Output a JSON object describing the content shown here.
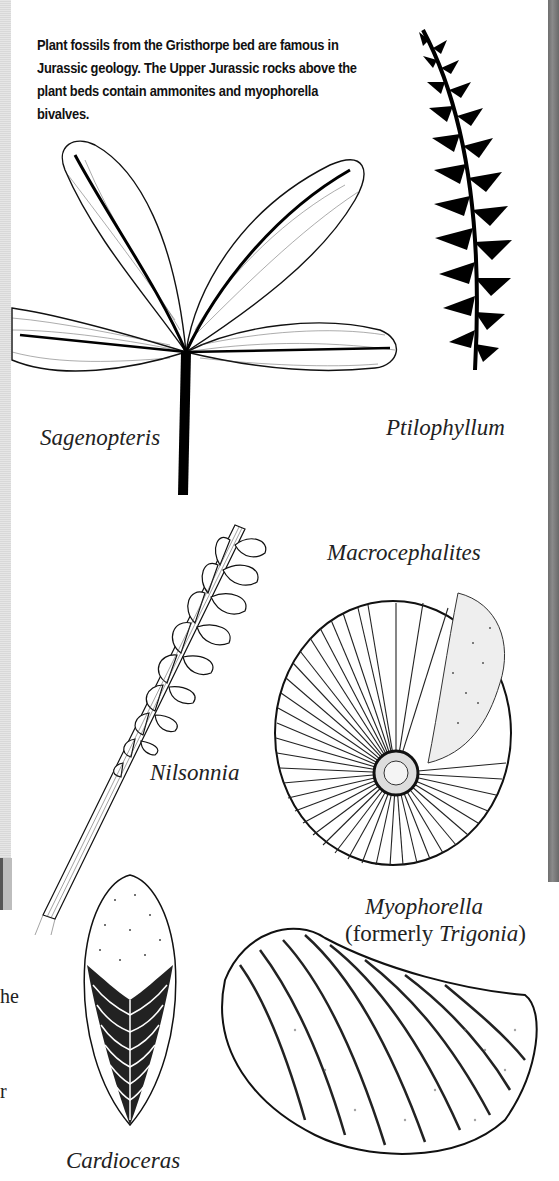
{
  "page": {
    "intro_text": "Plant fossils from the Gristhorpe bed are famous in Jurassic geology. The Upper Jurassic rocks above the plant beds contain ammonites and myophorella bivalves.",
    "cut_off_fragments": [
      "he",
      "r"
    ]
  },
  "figures": [
    {
      "id": "sagenopteris",
      "caption": "Sagenopteris",
      "icon": "sagenopteris-leaf-icon"
    },
    {
      "id": "ptilophyllum",
      "caption": "Ptilophyllum",
      "icon": "ptilophyllum-frond-icon"
    },
    {
      "id": "nilsonnia",
      "caption": "Nilsonnia",
      "icon": "nilsonnia-frond-icon"
    },
    {
      "id": "macrocephalites",
      "caption": "Macrocephalites",
      "icon": "ammonite-icon"
    },
    {
      "id": "myophorella",
      "caption_main": "Myophorella",
      "caption_paren_open": "(formerly ",
      "caption_alt": "Trigonia",
      "caption_paren_close": ")",
      "icon": "bivalve-shell-icon"
    },
    {
      "id": "cardioceras",
      "caption": "Cardioceras",
      "icon": "cardioceras-ammonite-icon"
    }
  ]
}
